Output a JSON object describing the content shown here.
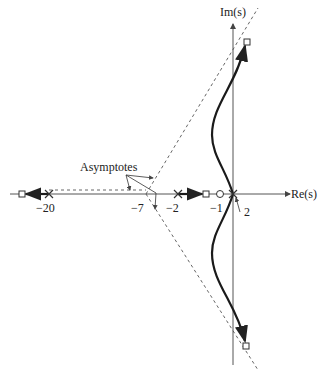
{
  "diagram": {
    "type": "root-locus",
    "axes": {
      "real_label": "Re(s)",
      "imag_label": "Im(s)"
    },
    "annotations": {
      "asymptotes_label": "Asymptotes",
      "tick_m20": "−20",
      "tick_m7": "−7",
      "tick_m2": "−2",
      "tick_m1": "−1",
      "multiplicity": "2"
    },
    "poles": [
      -20,
      -2,
      0,
      0
    ],
    "zeros": [
      -1
    ],
    "closed_loop_markers": [
      "square at far left",
      "square between -2 and -1",
      "square upper branch",
      "square lower branch"
    ],
    "asymptote_centroid": -7,
    "colors": {
      "locus": "#1a1a1a",
      "axis": "#555555",
      "asymptote": "#666666"
    }
  }
}
